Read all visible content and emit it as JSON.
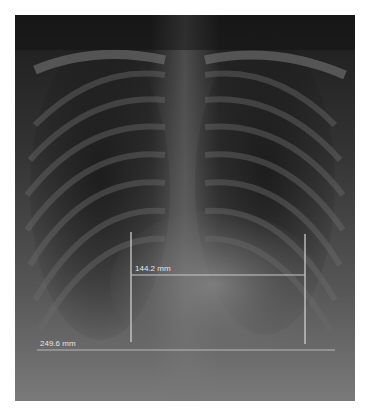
{
  "image": {
    "description": "Chest radiograph (PA view) with measurement annotations",
    "frame_border_color": "#d0d0d0"
  },
  "measurements": [
    {
      "id": "cardiac-width",
      "label": "144.2 mm",
      "type": "horizontal-with-verticals",
      "left_x": 131,
      "right_x": 305,
      "y": 275,
      "vertical_top": 232,
      "vertical_bottom": 342
    },
    {
      "id": "thoracic-width",
      "label": "249.6 mm",
      "type": "horizontal",
      "x1": 37,
      "x2": 335,
      "y": 350
    }
  ],
  "colors": {
    "annotation_line": "#d8d8d8",
    "annotation_text": "#e6e6e6",
    "background": "#ffffff"
  }
}
